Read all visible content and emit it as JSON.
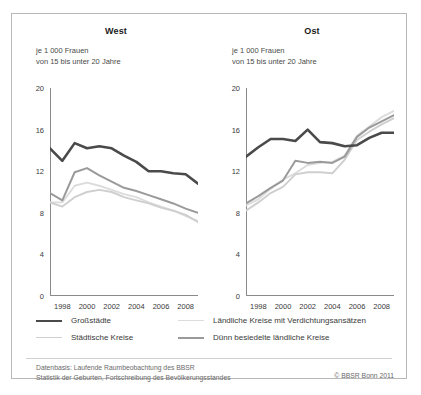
{
  "figure": {
    "footer_text": "Datenbasis: Laufende Raumbeobachtung des BBSR\nStatistik der Geburten, Fortschreibung des Bevölkerungsstandes",
    "copyright": "© BBSR Bonn 2011"
  },
  "legend": {
    "items": [
      {
        "label": "Großstädte",
        "color": "#4a4a4a",
        "width": 2.6,
        "row": 0,
        "col": 0
      },
      {
        "label": "Städtische Kreise",
        "color": "#cfcfcf",
        "width": 1.8,
        "row": 1,
        "col": 0
      },
      {
        "label": "Ländliche Kreise mit Verdichtungsansätzen",
        "color": "#dcdcdc",
        "width": 1.8,
        "row": 0,
        "col": 1
      },
      {
        "label": "Dünn besiedelte ländliche Kreise",
        "color": "#9a9a9a",
        "width": 2.0,
        "row": 1,
        "col": 1
      }
    ]
  },
  "chart_data": [
    {
      "type": "line",
      "title": "West",
      "subtitle": "je 1 000 Frauen\nvon 15 bis unter 20 Jahre",
      "xlabel": "",
      "ylabel": "",
      "ylim": [
        0,
        20
      ],
      "yticks": [
        0,
        4,
        8,
        12,
        16,
        20
      ],
      "ytick_labels": [
        "0",
        "4",
        "8",
        "12",
        "16",
        "20"
      ],
      "xlim": [
        1997,
        2009
      ],
      "xticks": [
        1997,
        1998,
        1999,
        2000,
        2001,
        2002,
        2003,
        2004,
        2005,
        2006,
        2007,
        2008,
        2009
      ],
      "xtick_labels": [
        "1998",
        "2000",
        "2002",
        "2004",
        "2006",
        "2008"
      ],
      "xtick_label_years": [
        1998,
        2000,
        2002,
        2004,
        2006,
        2008
      ],
      "grid": false,
      "legend_position": "below",
      "x": [
        1997,
        1998,
        1999,
        2000,
        2001,
        2002,
        2003,
        2004,
        2005,
        2006,
        2007,
        2008,
        2009
      ],
      "series": [
        {
          "name": "Großstädte",
          "color": "#4a4a4a",
          "width": 2.6,
          "values": [
            14.2,
            13.0,
            14.7,
            14.2,
            14.4,
            14.2,
            13.5,
            12.9,
            12.0,
            12.0,
            11.8,
            11.7,
            10.8
          ]
        },
        {
          "name": "Dünn besiedelte ländliche Kreise",
          "color": "#9a9a9a",
          "width": 2.0,
          "values": [
            9.9,
            9.2,
            11.9,
            12.3,
            11.6,
            11.0,
            10.4,
            10.1,
            9.7,
            9.3,
            8.9,
            8.4,
            8.0
          ]
        },
        {
          "name": "Ländliche Kreise mit Verdichtungsansätzen",
          "color": "#dcdcdc",
          "width": 1.9,
          "values": [
            9.0,
            9.0,
            10.6,
            10.9,
            10.6,
            10.2,
            9.8,
            9.5,
            9.0,
            8.6,
            8.2,
            7.7,
            7.2
          ]
        },
        {
          "name": "Städtische Kreise",
          "color": "#cfcfcf",
          "width": 1.9,
          "values": [
            9.0,
            8.6,
            9.5,
            10.0,
            10.2,
            10.0,
            9.5,
            9.2,
            8.9,
            8.5,
            8.2,
            7.8,
            7.1
          ]
        }
      ]
    },
    {
      "type": "line",
      "title": "Ost",
      "subtitle": "je 1 000 Frauen\nvon 15 bis unter 20 Jahre",
      "xlabel": "",
      "ylabel": "",
      "ylim": [
        0,
        20
      ],
      "yticks": [
        0,
        4,
        8,
        12,
        16,
        20
      ],
      "ytick_labels": [
        "0",
        "4",
        "8",
        "12",
        "16",
        "20"
      ],
      "xlim": [
        1997,
        2009
      ],
      "xticks": [
        1997,
        1998,
        1999,
        2000,
        2001,
        2002,
        2003,
        2004,
        2005,
        2006,
        2007,
        2008,
        2009
      ],
      "xtick_labels": [
        "1998",
        "2000",
        "2002",
        "2004",
        "2006",
        "2008"
      ],
      "xtick_label_years": [
        1998,
        2000,
        2002,
        2004,
        2006,
        2008
      ],
      "grid": false,
      "legend_position": "below",
      "x": [
        1997,
        1998,
        1999,
        2000,
        2001,
        2002,
        2003,
        2004,
        2005,
        2006,
        2007,
        2008,
        2009
      ],
      "series": [
        {
          "name": "Großstädte",
          "color": "#4a4a4a",
          "width": 2.6,
          "values": [
            13.4,
            14.3,
            15.1,
            15.1,
            14.9,
            16.0,
            14.8,
            14.7,
            14.4,
            14.5,
            15.2,
            15.7,
            15.7
          ]
        },
        {
          "name": "Dünn besiedelte ländliche Kreise",
          "color": "#9a9a9a",
          "width": 2.0,
          "values": [
            8.9,
            9.6,
            10.4,
            11.1,
            13.0,
            12.8,
            12.9,
            12.8,
            13.4,
            15.3,
            16.2,
            16.8,
            17.4
          ]
        },
        {
          "name": "Ländliche Kreise mit Verdichtungsansätzen",
          "color": "#dcdcdc",
          "width": 1.9,
          "values": [
            8.7,
            9.3,
            10.3,
            11.2,
            11.8,
            12.6,
            12.8,
            12.9,
            13.5,
            15.4,
            16.3,
            17.2,
            17.8
          ]
        },
        {
          "name": "Städtische Kreise",
          "color": "#cfcfcf",
          "width": 1.9,
          "values": [
            8.2,
            9.0,
            9.9,
            10.5,
            11.7,
            11.9,
            11.9,
            11.8,
            13.1,
            15.0,
            15.8,
            16.5,
            17.1
          ]
        }
      ]
    }
  ]
}
